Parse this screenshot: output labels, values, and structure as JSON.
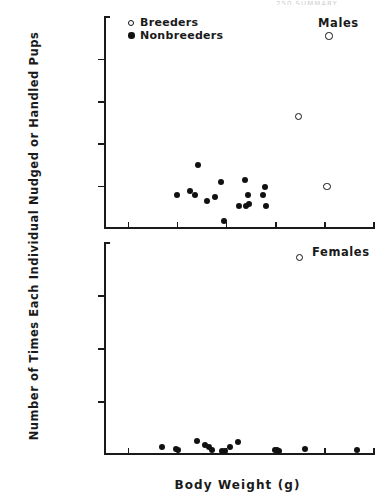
{
  "chart_data": {
    "type": "scatter",
    "title": "",
    "xlabel": "Body Weight (g)",
    "ylabel": "Number of Times Each Individual Nudged or Handled Pups",
    "xlim": [
      5,
      60
    ],
    "xticks": [
      10,
      20,
      30,
      40,
      50,
      60
    ],
    "grid": false,
    "legend_position": "top-left",
    "legend": [
      {
        "label": "Breeders",
        "marker": "open-circle"
      },
      {
        "label": "Nonbreeders",
        "marker": "filled-circle"
      }
    ],
    "panels": [
      {
        "name": "Males",
        "tag": "Males",
        "ylim": [
          0,
          100
        ],
        "yticks": [
          20,
          40,
          60,
          80,
          100
        ],
        "series": [
          {
            "name": "Breeders",
            "marker": "open-circle",
            "points": [
              {
                "x": 50.8,
                "y": 91
              },
              {
                "x": 44.6,
                "y": 53
              },
              {
                "x": 50.4,
                "y": 20
              }
            ]
          },
          {
            "name": "Nonbreeders",
            "marker": "filled-circle",
            "points": [
              {
                "x": 24.2,
                "y": 30
              },
              {
                "x": 28.8,
                "y": 22
              },
              {
                "x": 33.7,
                "y": 23
              },
              {
                "x": 22.6,
                "y": 18
              },
              {
                "x": 19.9,
                "y": 16
              },
              {
                "x": 23.6,
                "y": 16
              },
              {
                "x": 26.0,
                "y": 13
              },
              {
                "x": 27.6,
                "y": 15
              },
              {
                "x": 34.3,
                "y": 16
              },
              {
                "x": 37.7,
                "y": 20
              },
              {
                "x": 37.4,
                "y": 16
              },
              {
                "x": 32.6,
                "y": 11
              },
              {
                "x": 34.0,
                "y": 11
              },
              {
                "x": 34.6,
                "y": 12
              },
              {
                "x": 37.9,
                "y": 11
              },
              {
                "x": 29.5,
                "y": 4
              }
            ]
          }
        ]
      },
      {
        "name": "Females",
        "tag": "Females",
        "ylim": [
          0,
          360
        ],
        "yticks": [
          90,
          180,
          270,
          360
        ],
        "series": [
          {
            "name": "Breeders",
            "marker": "open-circle",
            "points": [
              {
                "x": 44.8,
                "y": 335
              }
            ]
          },
          {
            "name": "Nonbreeders",
            "marker": "filled-circle",
            "points": [
              {
                "x": 16.8,
                "y": 14
              },
              {
                "x": 19.6,
                "y": 10
              },
              {
                "x": 20.1,
                "y": 8
              },
              {
                "x": 23.9,
                "y": 24
              },
              {
                "x": 25.6,
                "y": 17
              },
              {
                "x": 26.4,
                "y": 13
              },
              {
                "x": 27.0,
                "y": 9
              },
              {
                "x": 29.1,
                "y": 7
              },
              {
                "x": 29.6,
                "y": 6
              },
              {
                "x": 30.6,
                "y": 13
              },
              {
                "x": 32.2,
                "y": 22
              },
              {
                "x": 39.8,
                "y": 8
              },
              {
                "x": 40.3,
                "y": 8
              },
              {
                "x": 40.7,
                "y": 7
              },
              {
                "x": 46.0,
                "y": 10
              },
              {
                "x": 56.6,
                "y": 9
              }
            ]
          }
        ]
      }
    ]
  },
  "annotations": {
    "crop_artifact": "250  SUMMARY"
  }
}
